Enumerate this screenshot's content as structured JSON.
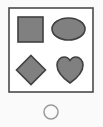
{
  "canvas": {
    "width": 103,
    "height": 127,
    "background_color": "#fafafa"
  },
  "panel": {
    "name": "shape-panel",
    "x": 9,
    "y": 8,
    "width": 84,
    "height": 84,
    "fill_color": "#ffffff",
    "border_color": "#4a4a4a",
    "border_width": 1.6
  },
  "shape_style": {
    "fill_color": "#808080",
    "stroke_color": "#404040",
    "stroke_width": 1.6
  },
  "shapes": [
    {
      "id": "square",
      "label": "Square",
      "icon": "square-icon",
      "position": "top-left",
      "x": 18,
      "y": 17,
      "width": 25,
      "height": 25
    },
    {
      "id": "ellipse",
      "label": "Ellipse",
      "icon": "ellipse-icon",
      "position": "top-right",
      "cx": 68.5,
      "cy": 29,
      "rx": 16.5,
      "ry": 11
    },
    {
      "id": "diamond",
      "label": "Diamond",
      "icon": "diamond-icon",
      "position": "bottom-left",
      "cx": 31,
      "cy": 70,
      "half_width": 14.5,
      "half_height": 14.5
    },
    {
      "id": "heart",
      "label": "Heart",
      "icon": "heart-icon",
      "position": "bottom-right",
      "cx": 70,
      "cy": 70,
      "width": 26,
      "height": 26
    }
  ],
  "marker": {
    "id": "circle-outline",
    "label": "Circle",
    "icon": "circle-outline-icon",
    "cx": 51,
    "cy": 112,
    "r": 7,
    "fill_color": "none",
    "stroke_color": "#9a9a9a",
    "stroke_width": 1.5
  }
}
